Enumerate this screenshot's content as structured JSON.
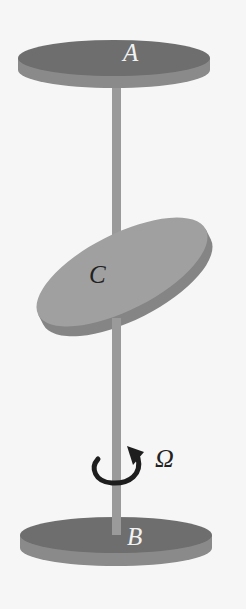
{
  "diagram": {
    "labels": {
      "disk_top": "A",
      "disk_middle": "C",
      "disk_bottom": "B",
      "angular_velocity": "Ω"
    },
    "colors": {
      "end_disk_top_face": "#6e6e6e",
      "end_disk_side": "#8a8a8a",
      "tilted_disk_face": "#a0a0a0",
      "tilted_disk_side": "#858585",
      "shaft": "#9a9a9a",
      "arrow": "#1e1e1e",
      "background": "#f6f6f6"
    }
  }
}
